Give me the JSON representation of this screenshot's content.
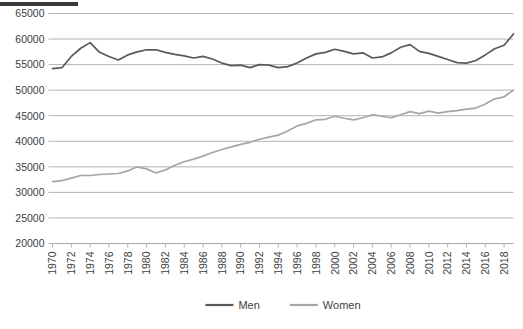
{
  "figure": {
    "redaction_bar": "redacted-title-bar",
    "background_color": "#ffffff"
  },
  "legend": {
    "position": "bottom-center",
    "entries": [
      {
        "label": "Men",
        "color": "#595959"
      },
      {
        "label": "Women",
        "color": "#a6a6a6"
      }
    ]
  },
  "chart_data": {
    "type": "line",
    "title": "",
    "subtitle": "",
    "xlabel": "",
    "ylabel": "",
    "xlim": [
      1970,
      2019
    ],
    "ylim": [
      20000,
      65000
    ],
    "ytick_step": 5000,
    "grid": true,
    "legend_position": "bottom-center",
    "ytick_labels": [
      "20000",
      "25000",
      "30000",
      "35000",
      "40000",
      "45000",
      "50000",
      "55000",
      "60000",
      "65000"
    ],
    "ytick_values": [
      20000,
      25000,
      30000,
      35000,
      40000,
      45000,
      50000,
      55000,
      60000,
      65000
    ],
    "xtick_labels": [
      "1970",
      "1972",
      "1974",
      "1976",
      "1978",
      "1980",
      "1982",
      "1984",
      "1986",
      "1988",
      "1990",
      "1992",
      "1994",
      "1996",
      "1998",
      "2000",
      "2002",
      "2004",
      "2006",
      "2008",
      "2010",
      "2012",
      "2014",
      "2016",
      "2018"
    ],
    "xtick_values": [
      1970,
      1972,
      1974,
      1976,
      1978,
      1980,
      1982,
      1984,
      1986,
      1988,
      1990,
      1992,
      1994,
      1996,
      1998,
      2000,
      2002,
      2004,
      2006,
      2008,
      2010,
      2012,
      2014,
      2016,
      2018
    ],
    "x": [
      1970,
      1971,
      1972,
      1973,
      1974,
      1975,
      1976,
      1977,
      1978,
      1979,
      1980,
      1981,
      1982,
      1983,
      1984,
      1985,
      1986,
      1987,
      1988,
      1989,
      1990,
      1991,
      1992,
      1993,
      1994,
      1995,
      1996,
      1997,
      1998,
      1999,
      2000,
      2001,
      2002,
      2003,
      2004,
      2005,
      2006,
      2007,
      2008,
      2009,
      2010,
      2011,
      2012,
      2013,
      2014,
      2015,
      2016,
      2017,
      2018,
      2019
    ],
    "series": [
      {
        "name": "Men",
        "color": "#595959",
        "values": [
          54200,
          54400,
          56600,
          58200,
          59300,
          57400,
          56600,
          55900,
          56900,
          57500,
          57900,
          57900,
          57400,
          57000,
          56700,
          56300,
          56600,
          56100,
          55300,
          54800,
          54900,
          54400,
          55000,
          54900,
          54400,
          54600,
          55300,
          56300,
          57100,
          57400,
          58000,
          57600,
          57100,
          57300,
          56300,
          56500,
          57300,
          58400,
          58900,
          57600,
          57200,
          56600,
          56000,
          55400,
          55300,
          55800,
          56900,
          58100,
          58800,
          61000
        ]
      },
      {
        "name": "Women",
        "color": "#a6a6a6",
        "values": [
          32100,
          32300,
          32800,
          33300,
          33300,
          33500,
          33600,
          33700,
          34200,
          35000,
          34600,
          33800,
          34400,
          35300,
          36000,
          36500,
          37100,
          37800,
          38400,
          38900,
          39400,
          39800,
          40400,
          40800,
          41200,
          42000,
          43000,
          43500,
          44200,
          44300,
          44900,
          44500,
          44200,
          44600,
          45200,
          44900,
          44600,
          45200,
          45800,
          45400,
          45900,
          45500,
          45800,
          46000,
          46300,
          46500,
          47300,
          48300,
          48700,
          50000
        ]
      }
    ]
  }
}
